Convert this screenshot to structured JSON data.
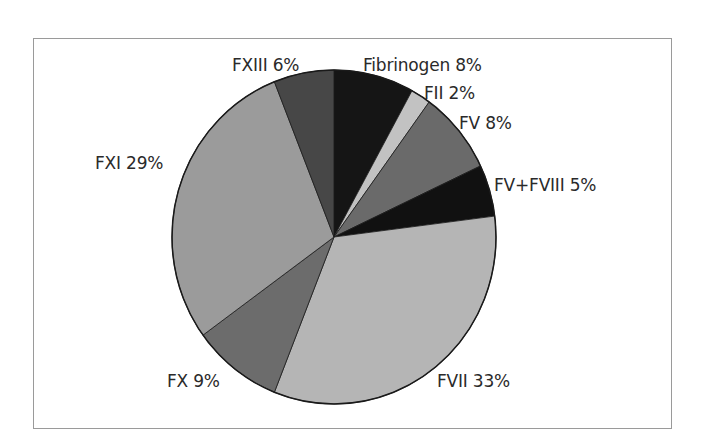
{
  "chart_data": {
    "type": "pie",
    "title": "",
    "categories": [
      "Fibrinogen",
      "FII",
      "FV",
      "FV+FVIII",
      "FVII",
      "FX",
      "FXI",
      "FXIII"
    ],
    "values": [
      8,
      2,
      8,
      5,
      33,
      9,
      29,
      6
    ],
    "unit": "%",
    "start_angle": "12 o'clock",
    "direction": "clockwise",
    "colors": [
      "#151515",
      "#c2c2c2",
      "#6a6a6a",
      "#111111",
      "#b5b5b5",
      "#6c6c6c",
      "#9b9b9b",
      "#474747"
    ],
    "legend": "none (direct labels)",
    "labels": [
      "Fibrinogen 8%",
      "FII 2%",
      "FV 8%",
      "FV+FVIII 5%",
      "FVII 33%",
      "FX 9%",
      "FXI 29%",
      "FXIII 6%"
    ]
  },
  "labels": {
    "fibrinogen": "Fibrinogen 8%",
    "fii": "FII 2%",
    "fv": "FV 8%",
    "fv_fviii": "FV+FVIII 5%",
    "fvii": "FVII 33%",
    "fx": "FX 9%",
    "fxi": "FXI 29%",
    "fxiii": "FXIII 6%"
  }
}
